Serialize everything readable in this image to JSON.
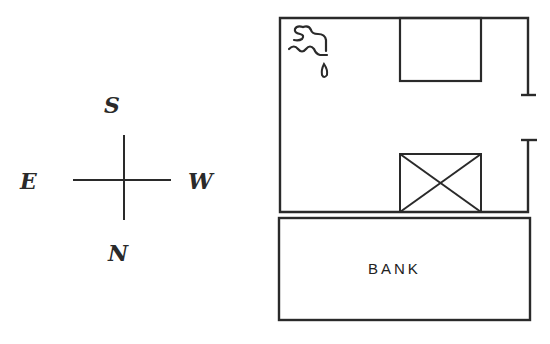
{
  "compass": {
    "top": "S",
    "left": "E",
    "right": "W",
    "bottom": "N"
  },
  "floorplan": {
    "room": {
      "features": [
        "faucet-icon",
        "box",
        "crossed-box",
        "doorway"
      ]
    },
    "bank": {
      "label": "BANK"
    }
  },
  "colors": {
    "line": "#2a2a2a",
    "background": "#ffffff"
  }
}
